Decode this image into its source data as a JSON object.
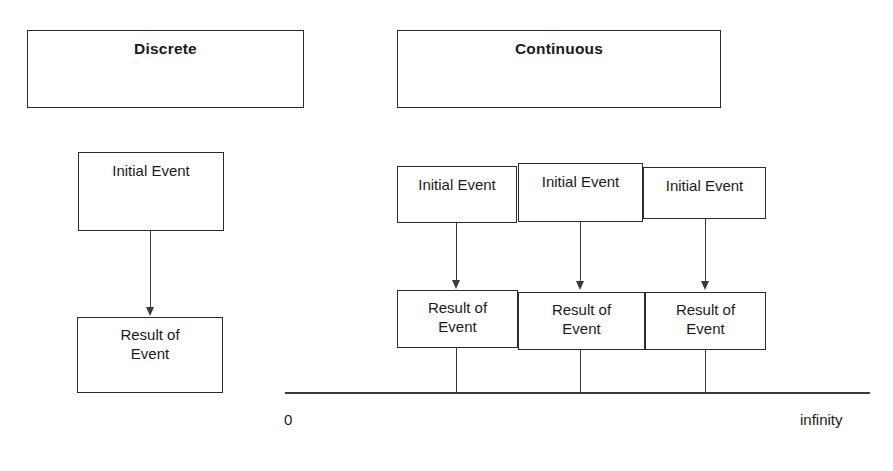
{
  "diagram": {
    "title_boxes": [
      {
        "label": "Discrete",
        "x": 27,
        "y": 30,
        "w": 277,
        "h": 78
      },
      {
        "label": "Continuous",
        "x": 397,
        "y": 30,
        "w": 324,
        "h": 78
      }
    ],
    "discrete": {
      "initial_event": {
        "label": "Initial Event",
        "x": 78,
        "y": 152,
        "w": 146,
        "h": 79
      },
      "result_event": {
        "label": "Result of\nEvent",
        "line1": "Result of",
        "line2": "Event",
        "x": 77,
        "y": 317,
        "w": 146,
        "h": 76
      },
      "arrow": {
        "x": 150,
        "y_start": 231,
        "y_end": 316
      }
    },
    "continuous": {
      "initial_events": [
        {
          "label": "Initial Event",
          "x": 397,
          "y": 166,
          "w": 120,
          "h": 57
        },
        {
          "label": "Initial Event",
          "x": 518,
          "y": 163,
          "w": 125,
          "h": 59
        },
        {
          "label": "Initial Event",
          "x": 643,
          "y": 167,
          "w": 123,
          "h": 52
        }
      ],
      "result_events": [
        {
          "line1": "Result of",
          "line2": "Event",
          "x": 397,
          "y": 290,
          "w": 121,
          "h": 58
        },
        {
          "line1": "Result of",
          "line2": "Event",
          "x": 518,
          "y": 292,
          "w": 127,
          "h": 58
        },
        {
          "line1": "Result of",
          "line2": "Event",
          "x": 645,
          "y": 292,
          "w": 121,
          "h": 58
        }
      ],
      "arrows": [
        {
          "x": 456,
          "y_start": 223,
          "y_end": 289
        },
        {
          "x": 580,
          "y_start": 222,
          "y_end": 291
        },
        {
          "x": 705,
          "y_start": 219,
          "y_end": 291
        }
      ],
      "ticks": [
        {
          "x": 456,
          "y_start": 348,
          "y_end": 393
        },
        {
          "x": 580,
          "y_start": 350,
          "y_end": 393
        },
        {
          "x": 705,
          "y_start": 350,
          "y_end": 393
        }
      ],
      "timeline": {
        "x": 285,
        "y": 392,
        "w": 585
      },
      "axis_start_label": "0",
      "axis_end_label": "infinity",
      "axis_start_label_pos": {
        "x": 284,
        "y": 411
      },
      "axis_end_label_pos": {
        "x": 800,
        "y": 411
      }
    },
    "colors": {
      "stroke": "#2b2b2b",
      "connector": "#3a3a3a",
      "text": "#1a1a1a",
      "background": "#ffffff"
    }
  }
}
